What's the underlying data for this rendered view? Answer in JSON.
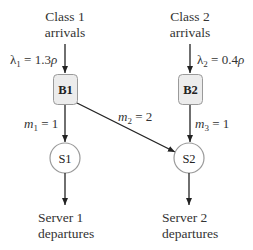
{
  "diagram": {
    "type": "queueing-network",
    "colors": {
      "line": "#222222",
      "box_fill": "#ececec",
      "box_stroke": "#9a9a9a",
      "circle_stroke": "#9a9a9a",
      "text": "#333333"
    },
    "sources": [
      {
        "line1": "Class 1",
        "line2": "arrivals",
        "rate_symbol": "λ",
        "rate_sub": "1",
        "rate_eq": " = 1.3",
        "rate_rho": "ρ"
      },
      {
        "line1": "Class 2",
        "line2": "arrivals",
        "rate_symbol": "λ",
        "rate_sub": "2",
        "rate_eq": " = 0.4",
        "rate_rho": "ρ"
      }
    ],
    "buffers": [
      {
        "label": "B1"
      },
      {
        "label": "B2"
      }
    ],
    "servers": [
      {
        "label": "S1"
      },
      {
        "label": "S2"
      }
    ],
    "edges": [
      {
        "from": "B1",
        "to": "S1",
        "symbol": "m",
        "sub": "1",
        "eq": " = 1"
      },
      {
        "from": "B1",
        "to": "S2",
        "symbol": "m",
        "sub": "2",
        "eq": " = 2"
      },
      {
        "from": "B2",
        "to": "S2",
        "symbol": "m",
        "sub": "3",
        "eq": " = 1"
      }
    ],
    "sinks": [
      {
        "line1": "Server 1",
        "line2": "departures"
      },
      {
        "line1": "Server 2",
        "line2": "departures"
      }
    ]
  }
}
